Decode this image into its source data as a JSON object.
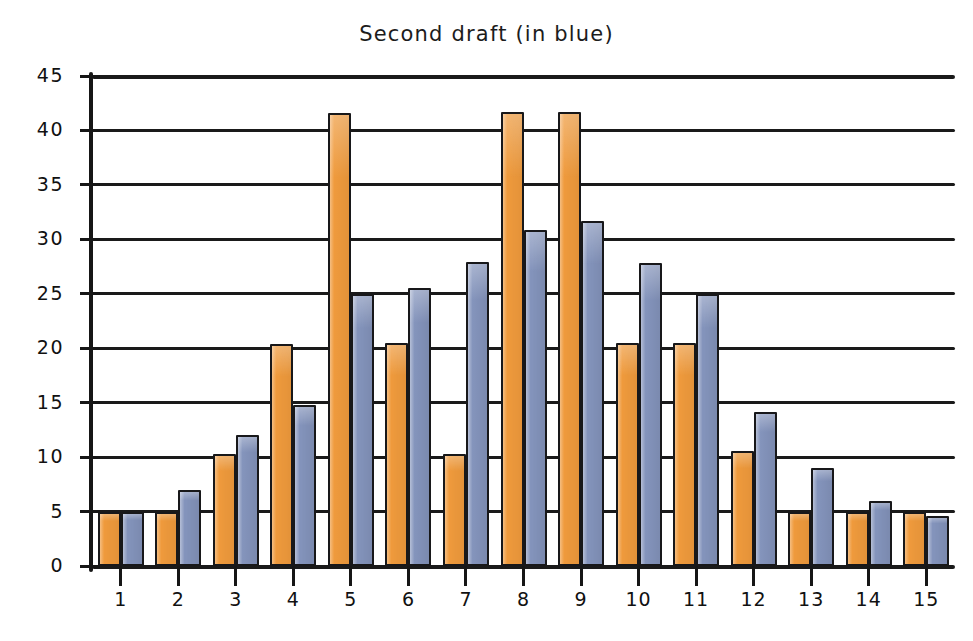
{
  "chart_data": {
    "type": "bar",
    "title": "Second draft (in blue)",
    "subtitle": "",
    "xlabel": "",
    "ylabel": "",
    "categories": [
      "1",
      "2",
      "3",
      "4",
      "5",
      "6",
      "7",
      "8",
      "9",
      "10",
      "11",
      "12",
      "13",
      "14",
      "15"
    ],
    "series": [
      {
        "name": "First draft",
        "color": "#ef9a3c",
        "values": [
          5,
          5,
          10.3,
          20.4,
          41.6,
          20.5,
          10.3,
          41.7,
          41.7,
          20.5,
          20.5,
          10.6,
          5,
          5,
          5
        ]
      },
      {
        "name": "Second draft (in blue)",
        "color": "#8494bc",
        "values": [
          5,
          7,
          12,
          14.8,
          25,
          25.5,
          27.9,
          30.9,
          31.7,
          27.8,
          25,
          14.1,
          9,
          6,
          4.6
        ]
      }
    ],
    "ylim": [
      0,
      45
    ],
    "yticks": [
      0,
      5,
      10,
      15,
      20,
      25,
      30,
      35,
      40,
      45
    ],
    "ytick_labels": [
      "0",
      "5",
      "10",
      "15",
      "20",
      "25",
      "30",
      "35",
      "40",
      "45"
    ],
    "xlim_categories": 15,
    "grid": true,
    "grid_axis": "y",
    "legend": false,
    "legend_position": "none",
    "style": "hand-drawn",
    "background": "#ffffff",
    "axis_color": "#1a1a1a"
  },
  "colors": {
    "series_orange": "#ef9a3c",
    "series_blue": "#8494bc",
    "ink": "#1a1a1a",
    "paper": "#ffffff"
  }
}
